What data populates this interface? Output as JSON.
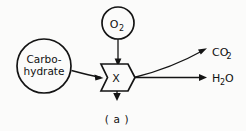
{
  "figure": {
    "caption": "( a )",
    "background_color": "#fbfbfa",
    "ink_color": "#141414"
  },
  "nodes": {
    "carbohydrate": {
      "label_line1": "Carbo-",
      "label_line2": "hydrate",
      "shape": "circle",
      "cx": 44,
      "cy": 66,
      "r": 27
    },
    "oxygen": {
      "label": "O",
      "subscript": "2",
      "shape": "circle",
      "cx": 118,
      "cy": 23,
      "r": 16
    },
    "process": {
      "label": "X",
      "shape": "banner-chevron",
      "cx": 117,
      "cy": 75
    }
  },
  "outputs": [
    {
      "label": "CO",
      "subscript": "2",
      "name": "carbon-dioxide",
      "x": 212,
      "y": 52
    },
    {
      "label": "H",
      "subscript": "2",
      "suffix": "O",
      "name": "water",
      "x": 212,
      "y": 79
    }
  ],
  "edges": [
    {
      "name": "carbohydrate-to-process",
      "from": "carbohydrate",
      "to": "process"
    },
    {
      "name": "oxygen-to-process",
      "from": "oxygen",
      "to": "process"
    },
    {
      "name": "process-to-carbon-dioxide",
      "from": "process",
      "to": "carbon-dioxide"
    },
    {
      "name": "process-to-water",
      "from": "process",
      "to": "water"
    },
    {
      "name": "process-energy-output",
      "from": "process",
      "to": "downward"
    }
  ]
}
